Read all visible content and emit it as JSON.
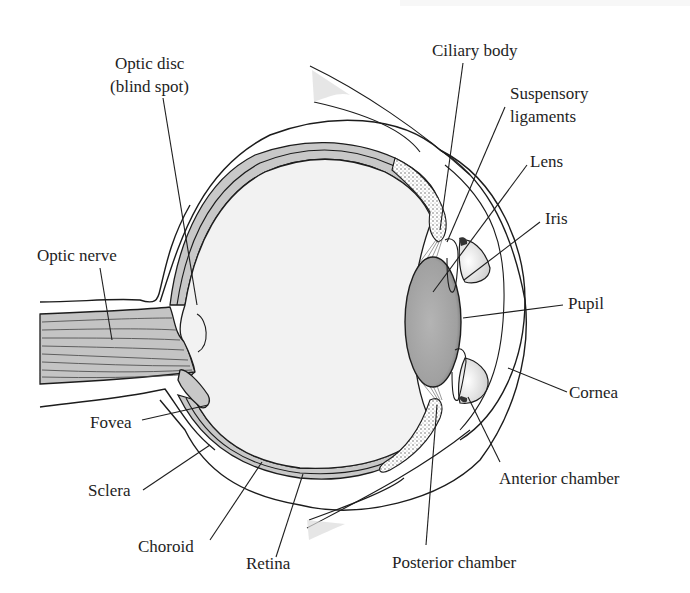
{
  "diagram": {
    "colors": {
      "background": "#ffffff",
      "vitreous_fill": "#f2f2f2",
      "layer_fill": "#c8c8c8",
      "lens_fill": "#a9a9a9",
      "nerve_fill": "#c4c4c4",
      "stroke": "#1c1c1c",
      "text": "#1e1e1e"
    },
    "labels": {
      "optic_disc_line1": "Optic disc",
      "optic_disc_line2": "(blind spot)",
      "optic_nerve": "Optic nerve",
      "fovea": "Fovea",
      "sclera": "Sclera",
      "choroid": "Choroid",
      "retina": "Retina",
      "ciliary_body": "Ciliary body",
      "suspensory_line1": "Suspensory",
      "suspensory_line2": "ligaments",
      "lens": "Lens",
      "iris": "Iris",
      "pupil": "Pupil",
      "cornea": "Cornea",
      "anterior_chamber": "Anterior chamber",
      "posterior_chamber": "Posterior chamber"
    }
  }
}
